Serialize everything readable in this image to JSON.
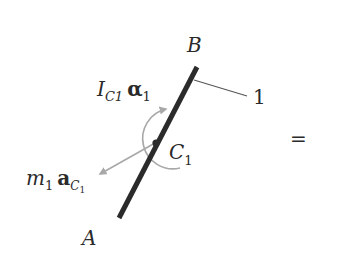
{
  "diagram": {
    "type": "free-body / kinetic diagram",
    "body_label": "1",
    "points": {
      "A": {
        "label": "A"
      },
      "B": {
        "label": "B"
      },
      "C1": {
        "label": "C",
        "subscript": "1"
      }
    },
    "moment": {
      "symbol_I": "I",
      "subscript": "C1",
      "symbol_alpha": "α",
      "alpha_subscript": "1"
    },
    "force": {
      "symbol_m": "m",
      "m_subscript": "1",
      "symbol_a": "a",
      "a_subscript": "C",
      "a_subsubscript": "1"
    },
    "equals_sign": "=",
    "colors": {
      "bar": "#2b2b2b",
      "arrow": "#a8a8a8",
      "leader": "#555555",
      "text": "#2a2a2a"
    }
  }
}
